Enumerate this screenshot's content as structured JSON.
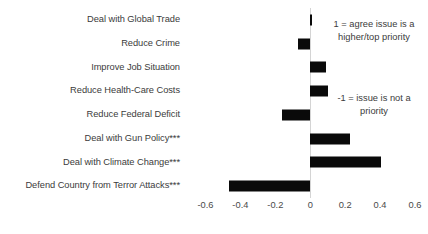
{
  "chart_data": {
    "type": "bar",
    "orientation": "horizontal",
    "title": "",
    "xlabel": "",
    "ylabel": "",
    "categories": [
      "Deal with Global Trade",
      "Reduce Crime",
      "Improve Job Situation",
      "Reduce Health-Care Costs",
      "Reduce Federal Deficit",
      "Deal with Gun Policy***",
      "Deal with Climate Change***",
      "Defend Country from Terror Attacks***"
    ],
    "values": [
      0.012,
      -0.068,
      0.093,
      0.103,
      -0.162,
      0.225,
      0.405,
      -0.468
    ],
    "xlim": [
      -0.7,
      0.64
    ],
    "xticks": [
      -0.6,
      -0.4,
      -0.2,
      0,
      0.2,
      0.4,
      0.6
    ],
    "xtick_labels": [
      "-0.6",
      "-0.4",
      "-0.2",
      "0",
      "0.2",
      "0.4",
      "0.6"
    ],
    "grid": false,
    "legend": "none",
    "bar_color": "#0a0a0a",
    "zero_line_color": "#d4d4d4",
    "annotations": [
      "1 = agree issue is a higher/top priority",
      "-1 = issue is not a priority"
    ]
  },
  "annotations": {
    "positive": "1 = agree issue is a higher/top priority",
    "negative": "-1 = issue is not a priority"
  }
}
